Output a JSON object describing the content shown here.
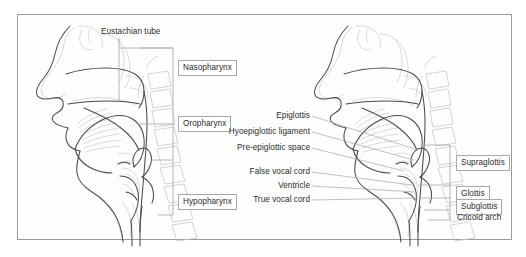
{
  "figure": {
    "frame": {
      "border_color": "#9a9a9a",
      "background": "#fefefe"
    },
    "colors": {
      "outline_dark": "#4a4a4a",
      "outline_light": "#c8c8c8",
      "leader_line": "#a6a6a6",
      "bracket_line": "#a6a6a6",
      "label_box_border": "#a8a8a8",
      "text": "#2b2b2b"
    }
  },
  "left_panel": {
    "name": "pharynx-subsites-diagram",
    "callout": {
      "label": "Eustachian tube",
      "boxed": false
    },
    "bracket_labels": [
      {
        "label": "Nasopharynx",
        "boxed": true
      },
      {
        "label": "Oropharynx",
        "boxed": true
      },
      {
        "label": "Hypopharynx",
        "boxed": true
      }
    ]
  },
  "right_panel": {
    "name": "larynx-subsites-diagram",
    "left_labels": [
      {
        "label": "Epiglottis",
        "boxed": false
      },
      {
        "label": "Hyoepiglottic ligament",
        "boxed": false
      },
      {
        "label": "Pre-epiglottic space",
        "boxed": false
      },
      {
        "label": "False vocal cord",
        "boxed": false
      },
      {
        "label": "Ventricle",
        "boxed": false
      },
      {
        "label": "True vocal cord",
        "boxed": false
      }
    ],
    "bracket_labels": [
      {
        "label": "Supraglottis",
        "boxed": true
      },
      {
        "label": "Glottis",
        "boxed": true
      },
      {
        "label": "Subglottis",
        "boxed": true
      },
      {
        "label": "Cricoid arch",
        "boxed": false
      }
    ]
  }
}
